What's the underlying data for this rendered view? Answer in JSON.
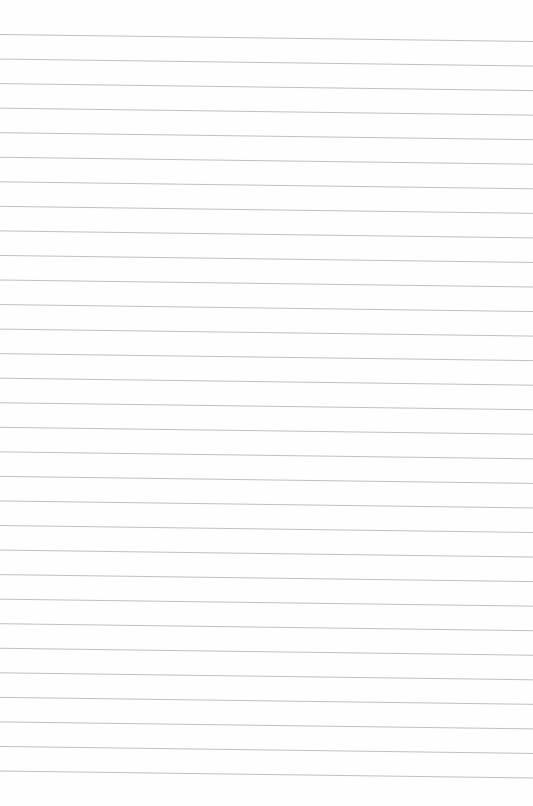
{
  "document": {
    "type": "ruled-paper",
    "line_count": 31,
    "line_color": "#b9b9b9",
    "paper_color": "#fefefe",
    "text": ""
  }
}
